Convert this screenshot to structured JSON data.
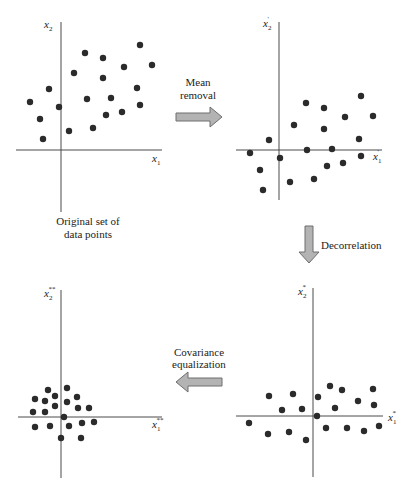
{
  "diagram": {
    "title": "",
    "panels": [
      {
        "id": "original",
        "caption": [
          "Original set of",
          "data points"
        ],
        "x_label": {
          "base": "x",
          "sub": "1",
          "prime": ""
        },
        "y_label": {
          "base": "x",
          "sub": "2",
          "prime": ""
        },
        "axes": {
          "origin": [
            61,
            150
          ],
          "x_range": [
            16,
            162
          ],
          "y_range": [
            22,
            212
          ]
        },
        "points": [
          [
            140,
            45
          ],
          [
            85,
            53
          ],
          [
            103,
            58
          ],
          [
            124,
            67
          ],
          [
            152,
            65
          ],
          [
            74,
            73
          ],
          [
            103,
            78
          ],
          [
            49,
            89
          ],
          [
            137,
            88
          ],
          [
            87,
            99
          ],
          [
            111,
            98
          ],
          [
            30,
            102
          ],
          [
            59,
            107
          ],
          [
            140,
            105
          ],
          [
            106,
            115
          ],
          [
            122,
            112
          ],
          [
            40,
            119
          ],
          [
            93,
            128
          ],
          [
            69,
            131
          ],
          [
            43,
            139
          ]
        ]
      },
      {
        "id": "mean-removed",
        "caption": [],
        "x_label": {
          "base": "x",
          "sub": "1",
          "prime": "'"
        },
        "y_label": {
          "base": "x",
          "sub": "2",
          "prime": "'"
        },
        "axes": {
          "origin": [
            279,
            150
          ],
          "x_range": [
            236,
            382
          ],
          "y_range": [
            22,
            200
          ]
        },
        "points": [
          [
            361,
            96
          ],
          [
            306,
            103
          ],
          [
            324,
            108
          ],
          [
            345,
            117
          ],
          [
            373,
            116
          ],
          [
            294,
            125
          ],
          [
            324,
            129
          ],
          [
            269,
            140
          ],
          [
            359,
            139
          ],
          [
            250,
            153
          ],
          [
            307,
            150
          ],
          [
            332,
            149
          ],
          [
            280,
            158
          ],
          [
            361,
            156
          ],
          [
            260,
            170
          ],
          [
            327,
            166
          ],
          [
            343,
            163
          ],
          [
            290,
            182
          ],
          [
            314,
            179
          ],
          [
            263,
            190
          ]
        ]
      },
      {
        "id": "decorrelated",
        "caption": [],
        "x_label": {
          "base": "x",
          "sub": "1",
          "prime": "*"
        },
        "y_label": {
          "base": "x",
          "sub": "2",
          "prime": "*"
        },
        "axes": {
          "origin": [
            313,
            416
          ],
          "x_range": [
            236,
            383
          ],
          "y_range": [
            288,
            477
          ]
        },
        "points": [
          [
            330,
            386
          ],
          [
            342,
            390
          ],
          [
            373,
            389
          ],
          [
            269,
            396
          ],
          [
            293,
            394
          ],
          [
            318,
            397
          ],
          [
            358,
            401
          ],
          [
            374,
            405
          ],
          [
            282,
            410
          ],
          [
            302,
            409
          ],
          [
            335,
            408
          ],
          [
            317,
            416
          ],
          [
            249,
            423
          ],
          [
            326,
            428
          ],
          [
            347,
            428
          ],
          [
            364,
            431
          ],
          [
            379,
            426
          ],
          [
            268,
            434
          ],
          [
            289,
            432
          ],
          [
            306,
            440
          ]
        ]
      },
      {
        "id": "covariance-equalized",
        "caption": [],
        "x_label": {
          "base": "x",
          "sub": "1",
          "prime": "**"
        },
        "y_label": {
          "base": "x",
          "sub": "2",
          "prime": "**"
        },
        "axes": {
          "origin": [
            61,
            417
          ],
          "x_range": [
            18,
            162
          ],
          "y_range": [
            290,
            478
          ]
        },
        "points": [
          [
            67,
            388
          ],
          [
            48,
            390
          ],
          [
            77,
            397
          ],
          [
            55,
            396
          ],
          [
            35,
            399
          ],
          [
            45,
            401
          ],
          [
            67,
            402
          ],
          [
            55,
            406
          ],
          [
            78,
            408
          ],
          [
            89,
            408
          ],
          [
            33,
            412
          ],
          [
            45,
            412
          ],
          [
            64,
            417
          ],
          [
            35,
            427
          ],
          [
            50,
            426
          ],
          [
            69,
            426
          ],
          [
            82,
            423
          ],
          [
            94,
            422
          ],
          [
            61,
            438
          ],
          [
            81,
            438
          ]
        ]
      }
    ],
    "transitions": [
      {
        "id": "mean-removal",
        "label": [
          "Mean",
          "removal"
        ],
        "direction": "right"
      },
      {
        "id": "decorrelation",
        "label": [
          "Decorrelation"
        ],
        "direction": "down"
      },
      {
        "id": "covariance-equalization",
        "label": [
          "Covariance",
          "equalization"
        ],
        "direction": "left"
      }
    ],
    "colors": {
      "dot": "#2b2b2b",
      "axis": "#4a4a4a",
      "arrow_fill": "#b3b3b3",
      "arrow_stroke": "#6e6e6e",
      "background": "#ffffff"
    }
  }
}
